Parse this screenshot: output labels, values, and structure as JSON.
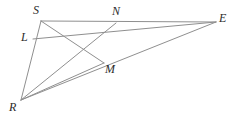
{
  "figure": {
    "type": "geometry-diagram",
    "width": 235,
    "height": 121,
    "background_color": "#ffffff",
    "line_color": "#8f8f8f",
    "label_color": "#2b2b2b",
    "line_width": 1
  },
  "points": {
    "S": {
      "label": "S",
      "x": 41,
      "y": 21,
      "label_x": 33,
      "label_y": 4
    },
    "N": {
      "label": "N",
      "x": 116,
      "y": 23,
      "label_x": 112,
      "label_y": 5
    },
    "E": {
      "label": "E",
      "x": 216,
      "y": 22,
      "label_x": 219,
      "label_y": 12
    },
    "L": {
      "label": "L",
      "x": 33,
      "y": 39,
      "label_x": 21,
      "label_y": 31
    },
    "M": {
      "label": "M",
      "x": 104,
      "y": 63,
      "label_x": 105,
      "label_y": 63
    },
    "R": {
      "label": "R",
      "x": 21,
      "y": 100,
      "label_x": 9,
      "label_y": 101
    }
  },
  "segments": [
    {
      "name": "segment-SE",
      "from": "S",
      "to": "E"
    },
    {
      "name": "segment-SR",
      "from": "S",
      "to": "R"
    },
    {
      "name": "segment-RE",
      "from": "R",
      "to": "E"
    },
    {
      "name": "segment-LE",
      "from": "L",
      "to": "E"
    },
    {
      "name": "segment-SM",
      "from": "S",
      "to": "M"
    },
    {
      "name": "segment-RN",
      "from": "R",
      "to": "N"
    },
    {
      "name": "segment-RM",
      "from": "R",
      "to": "M"
    }
  ],
  "labels": [
    "S",
    "N",
    "E",
    "L",
    "M",
    "R"
  ]
}
